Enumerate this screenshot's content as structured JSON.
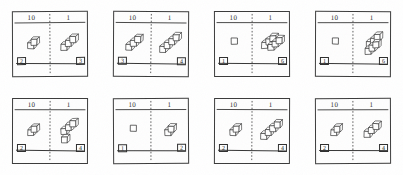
{
  "worksheet": {
    "title": "Place Value Base-Ten Blocks Worksheet",
    "column_headers": {
      "tens": "10",
      "ones": "1"
    },
    "ink_color": "#2e2e2e",
    "paper_color": "#ffffff",
    "divider_style": "dashed",
    "panels": [
      {
        "id": "panel-1",
        "tens_blocks": 2,
        "ones_blocks": 3,
        "tens_answer": "2",
        "ones_answer": "3",
        "tens_layout": "stack",
        "ones_layout": "diagonal"
      },
      {
        "id": "panel-2",
        "tens_blocks": 3,
        "ones_blocks": 4,
        "tens_answer": "3",
        "ones_answer": "4",
        "tens_layout": "diagonal",
        "ones_layout": "diagonal"
      },
      {
        "id": "panel-3",
        "tens_blocks": 1,
        "ones_blocks": 6,
        "tens_answer": "1",
        "ones_answer": "6",
        "tens_layout": "single",
        "ones_layout": "cluster"
      },
      {
        "id": "panel-4",
        "tens_blocks": 1,
        "ones_blocks": 6,
        "tens_answer": "1",
        "ones_answer": "6",
        "tens_layout": "single",
        "ones_layout": "double-diagonal"
      },
      {
        "id": "panel-5",
        "tens_blocks": 2,
        "ones_blocks": 4,
        "tens_answer": "2",
        "ones_answer": "4",
        "tens_layout": "stack",
        "ones_layout": "diagonal-plus-one"
      },
      {
        "id": "panel-6",
        "tens_blocks": 1,
        "ones_blocks": 2,
        "tens_answer": "1",
        "ones_answer": "2",
        "tens_layout": "single",
        "ones_layout": "stack"
      },
      {
        "id": "panel-7",
        "tens_blocks": 2,
        "ones_blocks": 4,
        "tens_answer": "2",
        "ones_answer": "4",
        "tens_layout": "stack",
        "ones_layout": "diagonal"
      },
      {
        "id": "panel-8",
        "tens_blocks": 2,
        "ones_blocks": 3,
        "tens_answer": "2",
        "ones_answer": "4",
        "tens_layout": "stack",
        "ones_layout": "diagonal"
      }
    ]
  }
}
